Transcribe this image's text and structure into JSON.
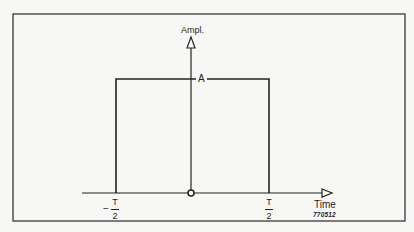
{
  "diagram": {
    "type": "rectangular-pulse",
    "y_axis": {
      "label": "Ampl."
    },
    "x_axis": {
      "label": "Time"
    },
    "amplitude_label": "A",
    "left_edge": {
      "sign": "−",
      "numerator": "T",
      "denominator": "2"
    },
    "right_edge": {
      "numerator": "T",
      "denominator": "2"
    },
    "origin_marker": "circle",
    "figure_number": "770512"
  },
  "colors": {
    "background": "#f7f7f5",
    "line": "#222222",
    "frame": "#3a3a3a"
  }
}
